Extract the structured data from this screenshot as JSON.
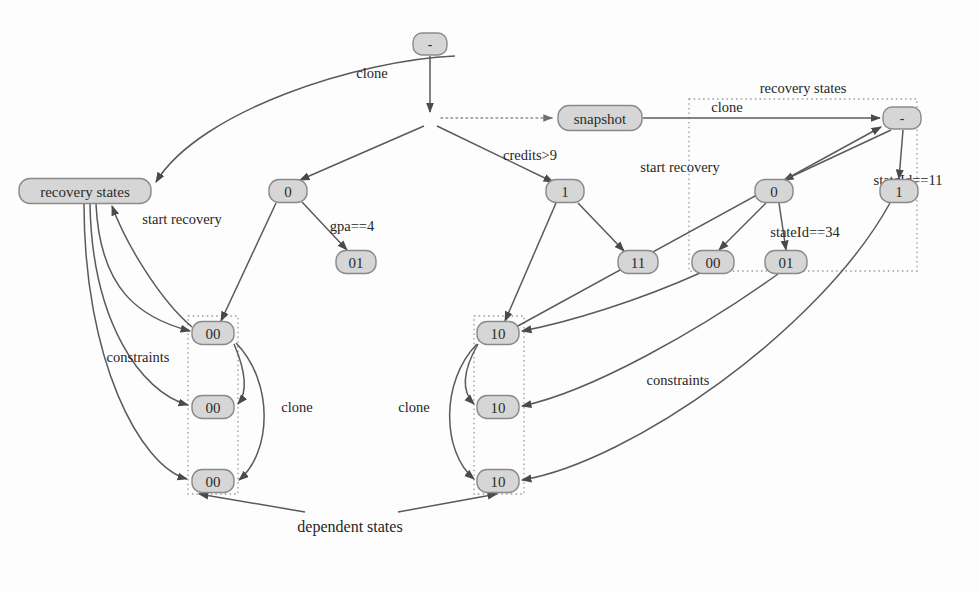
{
  "diagram": {
    "kind": "state-tree-clone-recovery-diagram",
    "background_color": "#fdfdfd",
    "node_fill": "#d6d6d6",
    "node_stroke": "#8a8a8a",
    "edge_color": "#5a5a5a",
    "dotted_color": "#9b9b9b",
    "nodes": [
      {
        "id": "root",
        "label": "-",
        "x": 430,
        "y": 44,
        "w": 34,
        "h": 22,
        "font_size": 14
      },
      {
        "id": "snapshot",
        "label": "snapshot",
        "x": 600,
        "y": 118,
        "w": 84,
        "h": 25,
        "font_size": 15
      },
      {
        "id": "recovery_states_left",
        "label": "recovery states",
        "x": 85,
        "y": 191,
        "w": 132,
        "h": 25,
        "font_size": 15
      },
      {
        "id": "left_0",
        "label": "0",
        "x": 288,
        "y": 191,
        "w": 38,
        "h": 23,
        "font_size": 15
      },
      {
        "id": "left_01",
        "label": "01",
        "x": 356,
        "y": 262,
        "w": 40,
        "h": 23,
        "font_size": 15
      },
      {
        "id": "mid_1",
        "label": "1",
        "x": 565,
        "y": 191,
        "w": 38,
        "h": 23,
        "font_size": 15
      },
      {
        "id": "mid_11",
        "label": "11",
        "x": 638,
        "y": 262,
        "w": 40,
        "h": 23,
        "font_size": 15
      },
      {
        "id": "rec_root",
        "label": "-",
        "x": 902,
        "y": 118,
        "w": 38,
        "h": 22,
        "font_size": 14
      },
      {
        "id": "rec_0",
        "label": "0",
        "x": 774,
        "y": 191,
        "w": 38,
        "h": 23,
        "font_size": 15
      },
      {
        "id": "rec_1",
        "label": "1",
        "x": 899,
        "y": 191,
        "w": 38,
        "h": 23,
        "font_size": 15
      },
      {
        "id": "rec_00",
        "label": "00",
        "x": 713,
        "y": 262,
        "w": 42,
        "h": 23,
        "font_size": 15
      },
      {
        "id": "rec_01",
        "label": "01",
        "x": 786,
        "y": 262,
        "w": 42,
        "h": 23,
        "font_size": 15
      },
      {
        "id": "dep00_a",
        "label": "00",
        "x": 213,
        "y": 333,
        "w": 42,
        "h": 23,
        "font_size": 15
      },
      {
        "id": "dep00_b",
        "label": "00",
        "x": 213,
        "y": 407,
        "w": 42,
        "h": 23,
        "font_size": 15
      },
      {
        "id": "dep00_c",
        "label": "00",
        "x": 213,
        "y": 481,
        "w": 42,
        "h": 23,
        "font_size": 15
      },
      {
        "id": "dep10_a",
        "label": "10",
        "x": 498,
        "y": 333,
        "w": 42,
        "h": 23,
        "font_size": 15
      },
      {
        "id": "dep10_b",
        "label": "10",
        "x": 498,
        "y": 407,
        "w": 42,
        "h": 23,
        "font_size": 15
      },
      {
        "id": "dep10_c",
        "label": "10",
        "x": 498,
        "y": 481,
        "w": 42,
        "h": 23,
        "font_size": 15
      }
    ],
    "group_boxes": [
      {
        "id": "recovery-states-group",
        "x": 689,
        "y": 99,
        "w": 228,
        "h": 172,
        "label": "recovery states",
        "label_x": 803,
        "label_y": 88
      },
      {
        "id": "dependent-states-group-left",
        "x": 188,
        "y": 316,
        "w": 50,
        "h": 178,
        "label": "",
        "label_x": 0,
        "label_y": 0
      },
      {
        "id": "dependent-states-group-right",
        "x": 474,
        "y": 316,
        "w": 50,
        "h": 178,
        "label": "",
        "label_x": 0,
        "label_y": 0
      }
    ],
    "edge_labels": [
      {
        "id": "clone-top",
        "text": "clone",
        "x": 372,
        "y": 73
      },
      {
        "id": "credits-gt-9",
        "text": "credits>9",
        "x": 530,
        "y": 155
      },
      {
        "id": "clone-right",
        "text": "clone",
        "x": 727,
        "y": 107
      },
      {
        "id": "state-id-11",
        "text": "stateId==11",
        "x": 908,
        "y": 180
      },
      {
        "id": "start-recovery-right",
        "text": "start recovery",
        "x": 680,
        "y": 167
      },
      {
        "id": "state-id-34",
        "text": "stateId==34",
        "x": 805,
        "y": 232
      },
      {
        "id": "start-recovery-left",
        "text": "start recovery",
        "x": 182,
        "y": 219
      },
      {
        "id": "gpa-eq-4",
        "text": "gpa==4",
        "x": 352,
        "y": 226
      },
      {
        "id": "constraints-left",
        "text": "constraints",
        "x": 138,
        "y": 357
      },
      {
        "id": "clone-left-col",
        "text": "clone",
        "x": 297,
        "y": 407
      },
      {
        "id": "clone-right-col",
        "text": "clone",
        "x": 414,
        "y": 407
      },
      {
        "id": "constraints-right",
        "text": "constraints",
        "x": 678,
        "y": 380
      },
      {
        "id": "dependent-states",
        "text": "dependent states",
        "x": 350,
        "y": 526
      }
    ],
    "edges": [
      {
        "id": "root-to-branch",
        "from": "root",
        "to": "branch-point",
        "kind": "solid-arrow"
      },
      {
        "id": "root-to-recovery-states-left",
        "from": "root",
        "to": "recovery_states_left",
        "label": "clone",
        "kind": "curved-arrow"
      },
      {
        "id": "branch-to-snapshot",
        "from": "branch-point",
        "to": "snapshot",
        "kind": "dotted-arrow"
      },
      {
        "id": "branch-to-left0",
        "from": "branch-point",
        "to": "left_0",
        "kind": "solid-arrow"
      },
      {
        "id": "branch-to-mid1",
        "from": "branch-point",
        "to": "mid_1",
        "label": "credits>9",
        "kind": "solid-arrow"
      },
      {
        "id": "left0-to-left01",
        "from": "left_0",
        "to": "left_01",
        "label": "gpa==4",
        "kind": "solid-arrow"
      },
      {
        "id": "left0-to-dep00a",
        "from": "left_0",
        "to": "dep00_a",
        "kind": "solid-arrow"
      },
      {
        "id": "mid1-to-mid11",
        "from": "mid_1",
        "to": "mid_11",
        "kind": "solid-arrow"
      },
      {
        "id": "mid1-to-dep10a",
        "from": "mid_1",
        "to": "dep10_a",
        "kind": "solid-arrow"
      },
      {
        "id": "snapshot-to-recroot",
        "from": "snapshot",
        "to": "rec_root",
        "label": "clone",
        "kind": "solid-arrow"
      },
      {
        "id": "recroot-to-rec0",
        "from": "rec_root",
        "to": "rec_0",
        "kind": "solid-arrow"
      },
      {
        "id": "recroot-to-rec1",
        "from": "rec_root",
        "to": "rec_1",
        "label": "stateId==11",
        "kind": "solid-arrow"
      },
      {
        "id": "rec0-to-rec00",
        "from": "rec_0",
        "to": "rec_00",
        "kind": "solid-arrow"
      },
      {
        "id": "rec0-to-rec01",
        "from": "rec_0",
        "to": "rec_01",
        "label": "stateId==34",
        "kind": "solid-arrow"
      },
      {
        "id": "dep10a-to-recroot",
        "from": "dep10_a",
        "to": "rec_root",
        "label": "start recovery",
        "kind": "solid-arrow"
      },
      {
        "id": "recstateleft-to-dep00a",
        "from": "recovery_states_left",
        "to": "dep00_a",
        "label": "constraints",
        "kind": "curved-arrow"
      },
      {
        "id": "recstateleft-to-dep00b",
        "from": "recovery_states_left",
        "to": "dep00_b",
        "kind": "curved-arrow"
      },
      {
        "id": "recstateleft-to-dep00c",
        "from": "recovery_states_left",
        "to": "dep00_c",
        "kind": "curved-arrow"
      },
      {
        "id": "dep00a-to-recstateleft",
        "from": "dep00_a",
        "to": "recovery_states_left",
        "label": "start recovery",
        "kind": "curved-arrow"
      },
      {
        "id": "dep00a-to-dep00b",
        "from": "dep00_a",
        "to": "dep00_b",
        "kind": "curved-arrow"
      },
      {
        "id": "dep00a-to-dep00c",
        "from": "dep00_a",
        "to": "dep00_c",
        "label": "clone",
        "kind": "curved-arrow"
      },
      {
        "id": "dep10a-to-dep10b",
        "from": "dep10_a",
        "to": "dep10_b",
        "label": "clone",
        "kind": "curved-arrow"
      },
      {
        "id": "dep10a-to-dep10c",
        "from": "dep10_a",
        "to": "dep10_c",
        "kind": "curved-arrow"
      },
      {
        "id": "rec00-to-dep10a",
        "from": "rec_00",
        "to": "dep10_a",
        "kind": "curved-arrow"
      },
      {
        "id": "rec01-to-dep10b",
        "from": "rec_01",
        "to": "dep10_b",
        "label": "constraints",
        "kind": "curved-arrow"
      },
      {
        "id": "rec1-to-dep10c",
        "from": "rec_1",
        "to": "dep10_c",
        "kind": "curved-arrow"
      },
      {
        "id": "dependent-states-to-left-box",
        "from": "dependent-states-label",
        "to": "dependent-states-group-left",
        "kind": "solid-arrow"
      },
      {
        "id": "dependent-states-to-right-box",
        "from": "dependent-states-label",
        "to": "dependent-states-group-right",
        "kind": "solid-arrow"
      }
    ]
  }
}
